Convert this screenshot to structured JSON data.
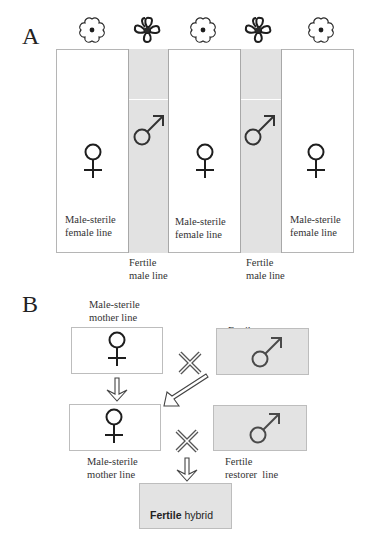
{
  "panel_a": {
    "label": "A",
    "flowers": [
      {
        "type": "sterile-flower",
        "x": 92
      },
      {
        "type": "fertile-flower",
        "x": 147
      },
      {
        "type": "sterile-flower",
        "x": 203
      },
      {
        "type": "fertile-flower",
        "x": 258
      },
      {
        "type": "sterile-flower",
        "x": 321
      }
    ],
    "columns": [
      {
        "kind": "female",
        "symbol": "female-symbol",
        "caption_line1": "Male-sterile",
        "caption_line2": "female line"
      },
      {
        "kind": "male",
        "symbol": "male-symbol",
        "caption_line1": "Fertile",
        "caption_line2": "male line"
      },
      {
        "kind": "female",
        "symbol": "female-symbol",
        "caption_line1": "Male-sterile",
        "caption_line2": "female line"
      },
      {
        "kind": "male",
        "symbol": "male-symbol",
        "caption_line1": "Fertile",
        "caption_line2": "male line"
      },
      {
        "kind": "female",
        "symbol": "female-symbol",
        "caption_line1": "Male-sterile",
        "caption_line2": "female line"
      }
    ]
  },
  "panel_b": {
    "label": "B",
    "row1": {
      "left": {
        "caption_line1": "Male-sterile",
        "caption_line2": "mother line",
        "symbol": "female-symbol"
      },
      "right": {
        "caption_line1": "Fertile",
        "caption_line2": "maintainer  line",
        "symbol": "male-symbol"
      },
      "operator": "cross-icon"
    },
    "row2": {
      "left": {
        "caption_line1": "Male-sterile",
        "caption_line2": "mother line",
        "symbol": "female-symbol"
      },
      "right": {
        "caption_line1": "Fertile",
        "caption_line2": "restorer  line",
        "symbol": "male-symbol"
      },
      "operator": "cross-icon"
    },
    "result": {
      "bold": "Fertile",
      "rest": " hybrid"
    }
  },
  "colors": {
    "fertile_fill": "#e3e3e3",
    "sterile_fill": "#ffffff",
    "border": "#bdbdbd",
    "symbol_dark": "#1e1e1e",
    "symbol_gray": "#4a4a4a"
  }
}
